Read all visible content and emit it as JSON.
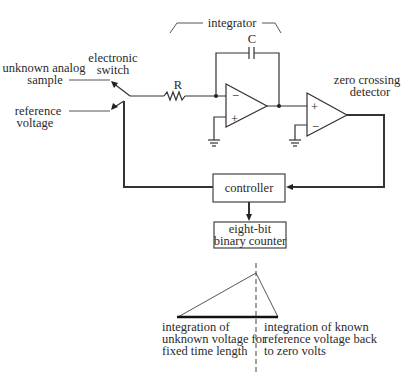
{
  "diagram": {
    "type": "dual-slope integrating ADC block diagram",
    "labels": {
      "integrator": "integrator",
      "capacitor": "C",
      "resistor": "R",
      "electronic_switch_line1": "electronic",
      "electronic_switch_line2": "switch",
      "unknown_line1": "unknown analog",
      "unknown_line2": "sample",
      "reference_line1": "reference",
      "reference_line2": "voltage",
      "zero_crossing_line1": "zero crossing",
      "zero_crossing_line2": "detector",
      "opamp_minus": "−",
      "opamp_plus": "+",
      "controller": "controller",
      "counter_line1": "eight-bit",
      "counter_line2": "binary counter"
    },
    "waveform": {
      "left_caption": [
        "integration of",
        "unknown voltage for",
        "fixed time length"
      ],
      "right_caption": [
        "integration of known",
        "reference voltage back",
        "to zero volts"
      ]
    },
    "colors": {
      "line": "#333333",
      "text": "#2a2a2a",
      "background": "#ffffff"
    }
  }
}
